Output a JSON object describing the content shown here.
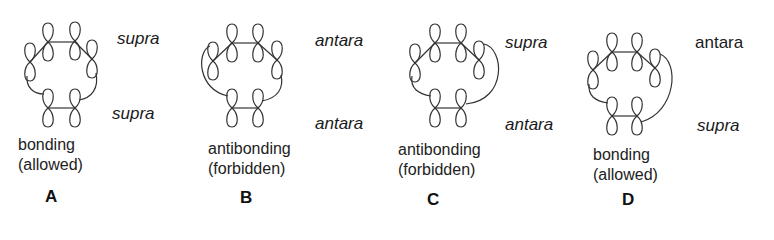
{
  "figure": {
    "stroke_color": "#333333",
    "panels": [
      {
        "id": "A",
        "letter": "A",
        "caption_line1": "bonding",
        "caption_line2": "(allowed)",
        "top_component": "supra",
        "bottom_component": "supra",
        "top_italic": true,
        "bottom_italic": true
      },
      {
        "id": "B",
        "letter": "B",
        "caption_line1": "antibonding",
        "caption_line2": "(forbidden)",
        "top_component": "antara",
        "bottom_component": "antara",
        "top_italic": true,
        "bottom_italic": true
      },
      {
        "id": "C",
        "letter": "C",
        "caption_line1": "antibonding",
        "caption_line2": "(forbidden)",
        "top_component": "supra",
        "bottom_component": "antara",
        "top_italic": true,
        "bottom_italic": true
      },
      {
        "id": "D",
        "letter": "D",
        "caption_line1": "bonding",
        "caption_line2": "(allowed)",
        "top_component": "antara",
        "bottom_component": "supra",
        "top_italic": false,
        "bottom_italic": true
      }
    ]
  }
}
